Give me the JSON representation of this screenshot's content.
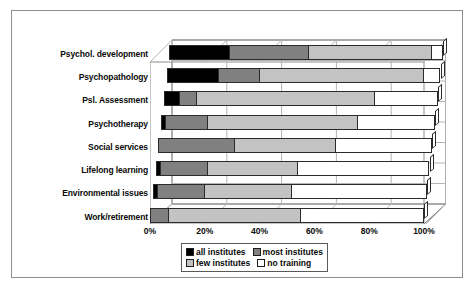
{
  "chart_data": {
    "type": "bar",
    "orientation": "horizontal",
    "stacked": true,
    "normalized_percent": true,
    "title": "",
    "subtitle": "",
    "xlabel": "",
    "ylabel": "",
    "xlim": [
      0,
      100
    ],
    "xticks": [
      "0%",
      "20%",
      "40%",
      "60%",
      "80%",
      "100%"
    ],
    "xtick_values": [
      0,
      20,
      40,
      60,
      80,
      100
    ],
    "grid": true,
    "legend_position": "bottom",
    "categories": [
      "Psychol. development",
      "Psychopathology",
      "Psl. Assessment",
      "Psychotherapy",
      "Social services",
      "Lifelong learning",
      "Environmental issues",
      "Work/retirement"
    ],
    "series": [
      {
        "name": "all institutes",
        "color": "#000000",
        "values": [
          22,
          19,
          6,
          2,
          0,
          2,
          2,
          0
        ]
      },
      {
        "name": "most institutes",
        "color": "#808080",
        "values": [
          29,
          15,
          6,
          15,
          28,
          17,
          17,
          7
        ]
      },
      {
        "name": "few institutes",
        "color": "#c3c3c3",
        "values": [
          45,
          60,
          65,
          55,
          37,
          33,
          32,
          48
        ]
      },
      {
        "name": "no training",
        "color": "#ffffff",
        "values": [
          4,
          6,
          23,
          28,
          35,
          48,
          49,
          45
        ]
      }
    ]
  },
  "legend": {
    "entries": [
      {
        "label": "all institutes",
        "swatch": "all"
      },
      {
        "label": "most institutes",
        "swatch": "most"
      },
      {
        "label": "few institutes",
        "swatch": "few"
      },
      {
        "label": "no training",
        "swatch": "none"
      }
    ]
  },
  "colors": {
    "all_institutes": "#000000",
    "most_institutes": "#808080",
    "few_institutes": "#c3c3c3",
    "no_training": "#ffffff",
    "outline": "#2b2b2b",
    "frame": "#8d8d8d",
    "gridline": "#b5b5b5"
  }
}
